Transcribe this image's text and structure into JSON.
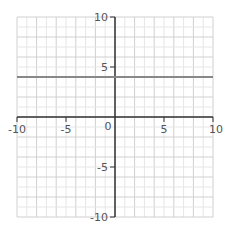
{
  "chart_data": {
    "type": "line",
    "title": "",
    "xlabel": "",
    "ylabel": "",
    "xlim": [
      -10,
      10
    ],
    "ylim": [
      -10,
      10
    ],
    "grid": true,
    "x_ticks": [
      -10,
      -5,
      0,
      5,
      10
    ],
    "y_ticks": [
      10,
      5,
      -5,
      -10
    ],
    "x_tick_labels": [
      "-10",
      "-5",
      "0",
      "5",
      "10"
    ],
    "y_tick_labels": [
      "10",
      "5",
      "-5",
      "-10"
    ],
    "origin_label": "0",
    "series": [
      {
        "name": "y = 4",
        "equation": "y = 4",
        "x": [
          -10,
          10
        ],
        "y": [
          4,
          4
        ],
        "color": "#888888"
      }
    ]
  },
  "colors": {
    "axis": "#333333",
    "grid_minor": "#e6e6e6",
    "grid_major": "#d0d0d0",
    "line": "#888888"
  },
  "labels": {
    "x_neg10": "-10",
    "x_neg5": "-5",
    "origin": "0",
    "x_5": "5",
    "x_10": "10",
    "y_10": "10",
    "y_5": "5",
    "y_neg5": "-5",
    "y_neg10": "-10"
  }
}
